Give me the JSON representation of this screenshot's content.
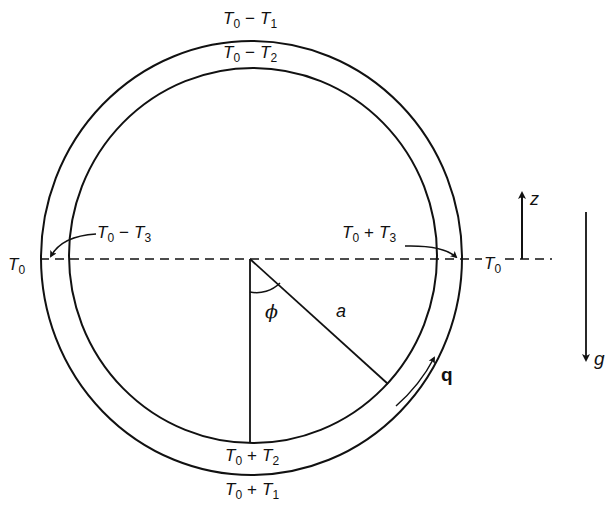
{
  "figure": {
    "type": "diagram"
  },
  "labels": {
    "top_outer": {
      "base": "T",
      "base_sub": "0",
      "op": "−",
      "term": "T",
      "term_sub": "1"
    },
    "top_inner": {
      "base": "T",
      "base_sub": "0",
      "op": "−",
      "term": "T",
      "term_sub": "2"
    },
    "left_side": {
      "base": "T",
      "base_sub": "0",
      "op": "−",
      "term": "T",
      "term_sub": "3"
    },
    "right_side": {
      "base": "T",
      "base_sub": "0",
      "op": "+",
      "term": "T",
      "term_sub": "3"
    },
    "bottom_inner": {
      "base": "T",
      "base_sub": "0",
      "op": "+",
      "term": "T",
      "term_sub": "2"
    },
    "bottom_outer": {
      "base": "T",
      "base_sub": "0",
      "op": "+",
      "term": "T",
      "term_sub": "1"
    },
    "left_T0": {
      "base": "T",
      "base_sub": "0"
    },
    "right_T0": {
      "base": "T",
      "base_sub": "0"
    },
    "angle": "ϕ",
    "radius": "a",
    "flow": "q",
    "z_axis": "z",
    "gravity": "g"
  },
  "geometry": {
    "outer_ellipse": {
      "cx": 251.5,
      "cy": 258,
      "rx": 210.5,
      "ry": 217
    },
    "inner_ellipse": {
      "cx": 253,
      "cy": 255.5,
      "rx": 184,
      "ry": 187.5
    },
    "center": {
      "x": 250,
      "y": 259
    },
    "vertical_radius_end": {
      "x": 250,
      "y": 443
    },
    "slanted_radius_end": {
      "x": 387,
      "y": 383
    },
    "horizontal_dash_y": 259,
    "z_arrow": {
      "x": 522,
      "y1": 259,
      "y2": 190
    },
    "g_arrow": {
      "x": 586,
      "y1": 212,
      "y2": 363
    },
    "line_color": "#111111"
  }
}
